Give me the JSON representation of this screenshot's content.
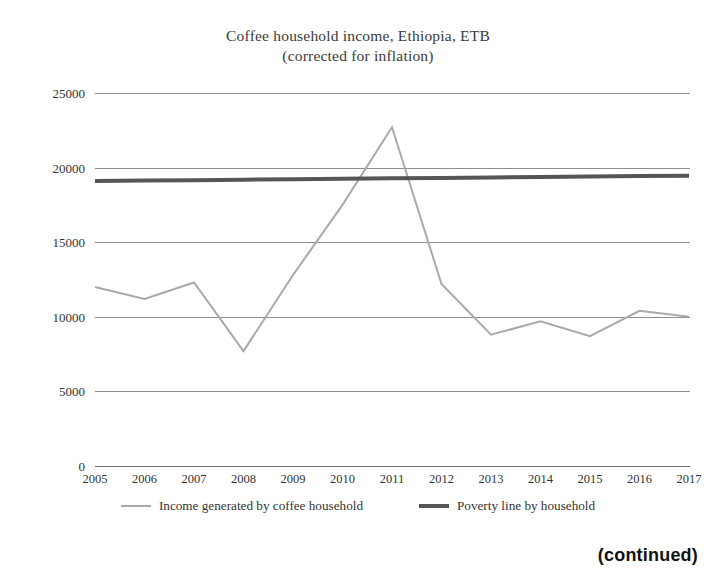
{
  "chart_data": {
    "type": "line",
    "title": "Coffee household income, Ethiopia, ETB",
    "subtitle": "(corrected for inflation)",
    "xlabel": "",
    "ylabel": "",
    "grid": true,
    "legend_position": "bottom",
    "x": [
      2005,
      2006,
      2007,
      2008,
      2009,
      2010,
      2011,
      2012,
      2013,
      2014,
      2015,
      2016,
      2017
    ],
    "categories": [
      "2005",
      "2006",
      "2007",
      "2008",
      "2009",
      "2010",
      "2011",
      "2012",
      "2013",
      "2014",
      "2015",
      "2016",
      "2017"
    ],
    "xlim": [
      2005,
      2017
    ],
    "ylim": [
      0,
      25000
    ],
    "yticks": [
      0,
      5000,
      10000,
      15000,
      20000,
      25000
    ],
    "ytick_labels": [
      "0",
      "5000",
      "10000",
      "15000",
      "20000",
      "25000"
    ],
    "series": [
      {
        "name": "Income generated by coffee household",
        "color": "#a9a9a9",
        "width": 2,
        "values": [
          12000,
          11200,
          12300,
          7700,
          12800,
          17500,
          22700,
          12200,
          8800,
          9700,
          8700,
          10400,
          10000
        ]
      },
      {
        "name": "Poverty line by household",
        "color": "#555555",
        "width": 4,
        "values": [
          19100,
          19130,
          19160,
          19190,
          19220,
          19250,
          19280,
          19310,
          19340,
          19370,
          19400,
          19430,
          19450
        ]
      }
    ]
  },
  "legend": {
    "items": [
      {
        "label": "Income generated by coffee household",
        "swatch": "income-line-swatch"
      },
      {
        "label": "Poverty line by household",
        "swatch": "poverty-line-swatch"
      }
    ]
  },
  "footer": {
    "continued_label": "(continued)"
  }
}
